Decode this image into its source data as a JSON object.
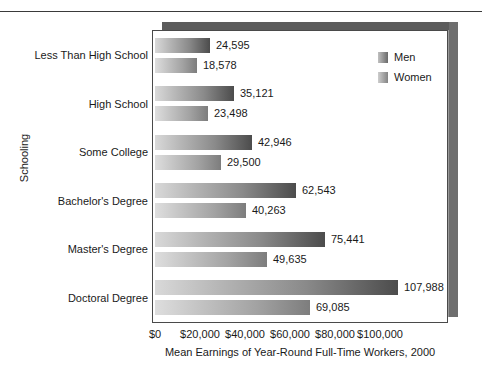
{
  "chart_data": {
    "type": "bar",
    "orientation": "horizontal",
    "title": "",
    "xlabel": "Mean Earnings of Year-Round Full-Time Workers, 2000",
    "ylabel": "Schooling",
    "categories": [
      "Less Than High School",
      "High School",
      "Some College",
      "Bachelor's Degree",
      "Master's Degree",
      "Doctoral Degree"
    ],
    "series": [
      {
        "name": "Men",
        "values": [
          24595,
          35121,
          42946,
          62543,
          75441,
          107988
        ],
        "labels": [
          "24,595",
          "35,121",
          "42,946",
          "62,543",
          "75,441",
          "107,988"
        ],
        "color": "#4c4c4c"
      },
      {
        "name": "Women",
        "values": [
          18578,
          23498,
          29500,
          40263,
          49635,
          69085
        ],
        "labels": [
          "18,578",
          "23,498",
          "29,500",
          "40,263",
          "49,635",
          "69,085"
        ],
        "color": "#7d7d7d"
      }
    ],
    "xlim": [
      0,
      130000
    ],
    "xticks": [
      0,
      20000,
      40000,
      60000,
      80000,
      100000
    ],
    "xtick_labels": [
      "$0",
      "$20,000",
      "$40,000",
      "$60,000",
      "$80,000",
      "$100,000"
    ],
    "grid": false,
    "legend_position": "top-right"
  },
  "legend": {
    "items": [
      {
        "label": "Men",
        "swatch": "men-swatch-icon"
      },
      {
        "label": "Women",
        "swatch": "women-swatch-icon"
      }
    ]
  }
}
